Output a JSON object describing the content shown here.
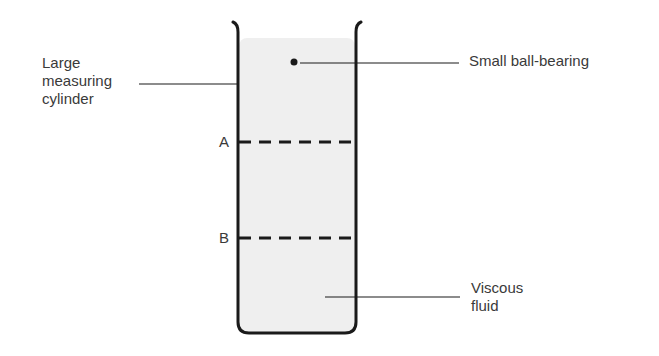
{
  "diagram": {
    "type": "apparatus",
    "labels": {
      "cylinder_line1": "Large",
      "cylinder_line2": "measuring",
      "cylinder_line3": "cylinder",
      "ball": "Small ball-bearing",
      "mark_a": "A",
      "mark_b": "B",
      "fluid_line1": "Viscous",
      "fluid_line2": "fluid"
    },
    "colors": {
      "stroke": "#1a1a1a",
      "fluid": "#efefef",
      "text": "#3a3a3a"
    }
  }
}
